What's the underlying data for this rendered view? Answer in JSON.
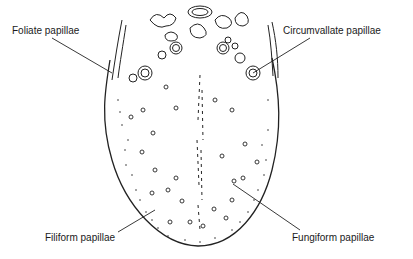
{
  "diagram": {
    "labels": {
      "foliate": "Foliate papillae",
      "circumvallate": "Circumvallate papillae",
      "filiform": "Filiform papillae",
      "fungiform": "Fungiform papillae"
    }
  }
}
